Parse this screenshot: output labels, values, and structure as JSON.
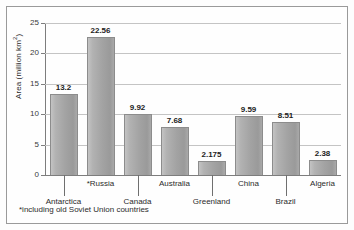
{
  "chart_data": {
    "type": "bar",
    "title": "",
    "subtitle": "",
    "xlabel": "",
    "ylabel": "Area (million km",
    "ylabel_sup": "2",
    "ylabel_suffix": ")",
    "ylim": [
      0,
      25
    ],
    "yticks": [
      0,
      5,
      10,
      15,
      20,
      25
    ],
    "ytick_labels": [
      "0",
      "5",
      "10",
      "15",
      "20",
      "25"
    ],
    "grid": true,
    "grid_axis": "y",
    "legend": "none",
    "categories": [
      "Antarctica",
      "*Russia",
      "Canada",
      "Australia",
      "Greenland",
      "China",
      "Brazil",
      "Algeria"
    ],
    "values": [
      13.2,
      22.56,
      9.92,
      7.68,
      2.175,
      9.59,
      8.51,
      2.38
    ],
    "value_labels": [
      "13.2",
      "22.56",
      "9.92",
      "7.68",
      "2.175",
      "9.59",
      "8.51",
      "2.38"
    ],
    "label_rows": [
      "low",
      "high",
      "low",
      "high",
      "low",
      "high",
      "low",
      "high"
    ],
    "annotations": [
      "*including old Soviet Union countries"
    ],
    "colors": {
      "bar_fill_light": "#c3c3c3",
      "bar_fill_dark": "#9a9a9a",
      "bar_stroke": "#8c8c8c",
      "gridline": "#c4c4c4",
      "axis": "#7d7d7d",
      "text": "#2b2b2b",
      "frame": "#9a9a9a",
      "background": "#fefefe"
    }
  },
  "footnote": "*including old Soviet Union countries"
}
